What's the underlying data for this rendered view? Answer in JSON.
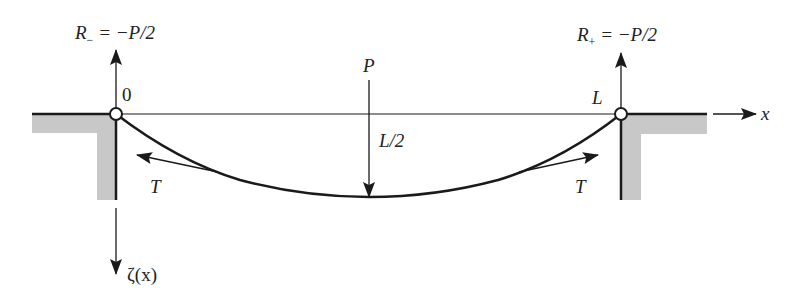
{
  "figure": {
    "type": "string/cable under point load",
    "labels": {
      "left_reaction_symbol": "R",
      "left_reaction_subscript": "−",
      "left_reaction_value": " = −P/2",
      "right_reaction_symbol": "R",
      "right_reaction_subscript": "+",
      "right_reaction_value": " = −P/2",
      "origin": "0",
      "right_end": "L",
      "load": "P",
      "load_position": "L/2",
      "tension_left": "T",
      "tension_right": "T",
      "x_axis": "x",
      "deflection_axis": "ζ(x)"
    },
    "colors": {
      "line": "#1a1a1a",
      "support_fill": "#c8c8c8",
      "background": "#ffffff"
    },
    "geometry": {
      "left_pin": [
        116,
        114
      ],
      "right_pin": [
        621,
        114
      ],
      "load_point": [
        369,
        197
      ]
    }
  }
}
